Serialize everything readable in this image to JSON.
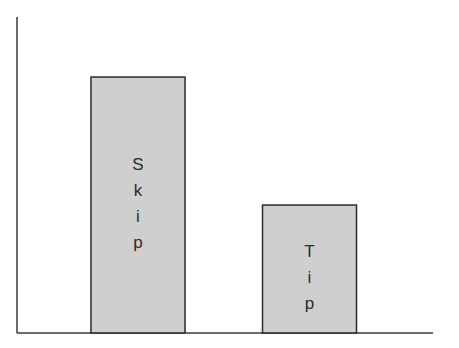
{
  "chart_data": {
    "type": "bar",
    "title": "",
    "xlabel": "",
    "ylabel": "",
    "categories": [
      "Skip",
      "Tip"
    ],
    "values": [
      0.81,
      0.405
    ],
    "value_units": "fraction of y-axis height (no tick labels shown)",
    "ylim": [
      0,
      1
    ],
    "grid": false,
    "legend": "none",
    "bar_labels": [
      "Skip",
      "Tip"
    ],
    "bar_label_orientation": "vertical-stacked-letters",
    "colors": {
      "bar_fill": "#cfcfcf",
      "bar_stroke": "#2a2a2a",
      "axis": "#3a3a3a"
    }
  }
}
